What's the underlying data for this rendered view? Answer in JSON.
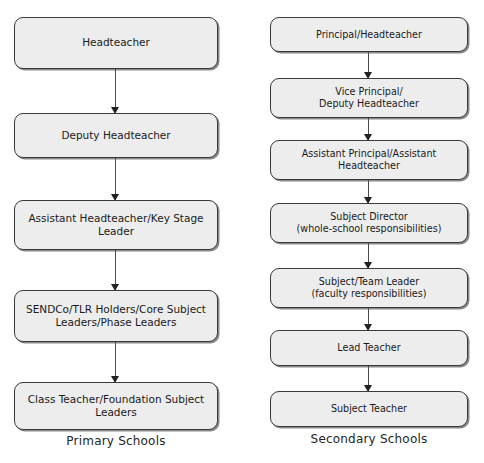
{
  "diagram": {
    "type": "flowchart",
    "title": "",
    "columns": [
      {
        "id": "primary",
        "caption": "Primary Schools",
        "nodes": [
          {
            "label": "Headteacher",
            "top": 17,
            "height": 52
          },
          {
            "label": "Deputy Headteacher",
            "top": 113,
            "height": 45
          },
          {
            "label": "Assistant Headteacher/Key Stage\nLeader",
            "top": 200,
            "height": 50
          },
          {
            "label": "SENDCo/TLR Holders/Core Subject\nLeaders/Phase Leaders",
            "top": 290,
            "height": 52
          },
          {
            "label": "Class Teacher/Foundation Subject\nLeaders",
            "top": 382,
            "height": 48
          }
        ],
        "connectors": [
          {
            "top": 69,
            "height": 44
          },
          {
            "top": 158,
            "height": 42
          },
          {
            "top": 250,
            "height": 40
          },
          {
            "top": 342,
            "height": 40
          }
        ]
      },
      {
        "id": "secondary",
        "caption": "Secondary Schools",
        "nodes": [
          {
            "label": "Principal/Headteacher",
            "top": 17,
            "height": 35
          },
          {
            "label": "Vice Principal/\nDeputy Headteacher",
            "top": 78,
            "height": 40
          },
          {
            "label": "Assistant Principal/Assistant\nHeadteacher",
            "top": 140,
            "height": 40
          },
          {
            "label": "Subject Director\n(whole-school responsibilities)",
            "top": 203,
            "height": 40
          },
          {
            "label": "Subject/Team Leader\n(faculty responsibilities)",
            "top": 268,
            "height": 40
          },
          {
            "label": "Lead Teacher",
            "top": 330,
            "height": 36
          },
          {
            "label": "Subject Teacher",
            "top": 391,
            "height": 36
          }
        ],
        "connectors": [
          {
            "top": 52,
            "height": 26
          },
          {
            "top": 118,
            "height": 22
          },
          {
            "top": 180,
            "height": 23
          },
          {
            "top": 243,
            "height": 25
          },
          {
            "top": 308,
            "height": 22
          },
          {
            "top": 366,
            "height": 25
          }
        ]
      }
    ]
  },
  "colors": {
    "node_fill": "#ededed",
    "node_border": "#3a3a3a",
    "arrow": "#4a4a4a",
    "text": "#1a1a1a",
    "background": "#ffffff"
  }
}
